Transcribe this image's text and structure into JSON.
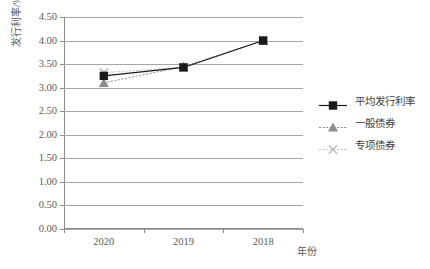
{
  "chart_data": {
    "type": "line",
    "title": "",
    "xlabel": "年份",
    "ylabel": "发行利率/%",
    "categories": [
      "2020",
      "2019",
      "2018"
    ],
    "ylim": [
      0.0,
      4.5
    ],
    "ytick_step": 0.5,
    "ytick_labels": [
      "4.50",
      "4.00",
      "3.50",
      "3.00",
      "2.50",
      "2.00",
      "1.50",
      "1.00",
      "0.50",
      "0.00"
    ],
    "ytick_values": [
      4.5,
      4.0,
      3.5,
      3.0,
      2.5,
      2.0,
      1.5,
      1.0,
      0.5,
      0.0
    ],
    "grid": "horizontal",
    "legend_position": "right",
    "series": [
      {
        "name": "平均发行利率",
        "values": [
          3.25,
          3.43,
          4.0
        ],
        "marker": "square",
        "line": "solid",
        "color": "#1a1a1a"
      },
      {
        "name": "一般债券",
        "values": [
          3.1,
          3.45,
          4.0
        ],
        "marker": "triangle",
        "line": "dotted",
        "color": "#8c8c8c"
      },
      {
        "name": "专项债券",
        "values": [
          3.32,
          3.43,
          4.0
        ],
        "marker": "x",
        "line": "dotted",
        "color": "#bfbfbf"
      }
    ]
  },
  "legend": {
    "items": [
      {
        "label": "平均发行利率"
      },
      {
        "label": "一般债券"
      },
      {
        "label": "专项债券"
      }
    ]
  },
  "axes": {
    "y_title": "发行利率/%",
    "x_title": "年份"
  },
  "colors": {
    "axis": "#8c8c8c",
    "grid": "#a6a6a6",
    "text": "#5a5a5a",
    "series_avg": "#1a1a1a",
    "series_general": "#8c8c8c",
    "series_special": "#bfbfbf"
  }
}
